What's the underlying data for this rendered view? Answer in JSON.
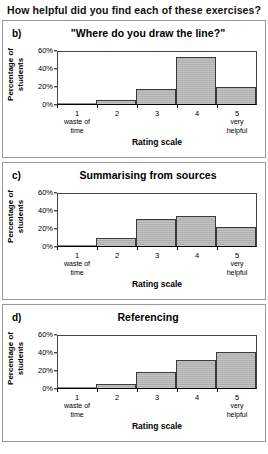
{
  "page": {
    "heading": "How helpful did you find each of these exercises?"
  },
  "axis": {
    "ylabel": "Percentage of students",
    "xlabel": "Rating scale",
    "yticks": [
      "60%",
      "40%",
      "20%",
      "0%"
    ],
    "xcategories": [
      {
        "num": "1",
        "sub1": "waste of",
        "sub2": "time"
      },
      {
        "num": "2",
        "sub1": "",
        "sub2": ""
      },
      {
        "num": "3",
        "sub1": "",
        "sub2": ""
      },
      {
        "num": "4",
        "sub1": "",
        "sub2": ""
      },
      {
        "num": "5",
        "sub1": "very",
        "sub2": "helpful"
      }
    ]
  },
  "panels": [
    {
      "letter": "b)",
      "title": "\"Where do you draw the line?\""
    },
    {
      "letter": "c)",
      "title": "Summarising from sources"
    },
    {
      "letter": "d)",
      "title": "Referencing"
    }
  ],
  "chart_data": [
    {
      "type": "bar",
      "title": "\"Where do you draw the line?\"",
      "panel": "b)",
      "categories": [
        "1",
        "2",
        "3",
        "4",
        "5"
      ],
      "category_labels": [
        "1 waste of time",
        "2",
        "3",
        "4",
        "5 very helpful"
      ],
      "values": [
        1,
        5,
        17,
        54,
        20
      ],
      "xlabel": "Rating scale",
      "ylabel": "Percentage of students",
      "ylim": [
        0,
        60
      ],
      "yticks": [
        0,
        20,
        40,
        60
      ],
      "grid": false,
      "legend": "none"
    },
    {
      "type": "bar",
      "title": "Summarising from sources",
      "panel": "c)",
      "categories": [
        "1",
        "2",
        "3",
        "4",
        "5"
      ],
      "category_labels": [
        "1 waste of time",
        "2",
        "3",
        "4",
        "5 very helpful"
      ],
      "values": [
        1,
        9,
        31,
        35,
        22
      ],
      "xlabel": "Rating scale",
      "ylabel": "Percentage of students",
      "ylim": [
        0,
        60
      ],
      "yticks": [
        0,
        20,
        40,
        60
      ],
      "grid": false,
      "legend": "none"
    },
    {
      "type": "bar",
      "title": "Referencing",
      "panel": "d)",
      "categories": [
        "1",
        "2",
        "3",
        "4",
        "5"
      ],
      "category_labels": [
        "1 waste of time",
        "2",
        "3",
        "4",
        "5 very helpful"
      ],
      "values": [
        1,
        5,
        18,
        32,
        41
      ],
      "xlabel": "Rating scale",
      "ylabel": "Percentage of students",
      "ylim": [
        0,
        60
      ],
      "yticks": [
        0,
        20,
        40,
        60
      ],
      "grid": false,
      "legend": "none"
    }
  ],
  "colors": {
    "bar_fill": "#b5b5b5",
    "bar_border": "#3a3a3a",
    "panel_border": "#9a9a9a",
    "text": "#000000"
  }
}
